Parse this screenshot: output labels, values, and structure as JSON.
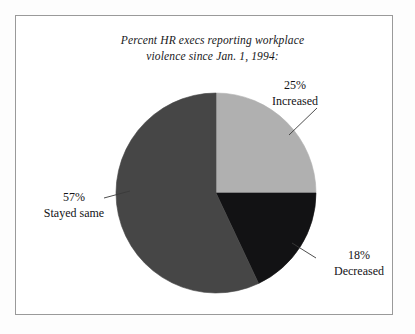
{
  "figure": {
    "title_line1": "Percent HR execs reporting workplace",
    "title_line2": "violence since Jan. 1, 1994:",
    "frame_color": "#9a9a9a",
    "background": "#ffffff"
  },
  "chart_data": {
    "type": "pie",
    "title": "Percent HR execs reporting workplace violence since Jan. 1, 1994:",
    "categories": [
      "Increased",
      "Decreased",
      "Stayed same"
    ],
    "values": [
      25,
      18,
      57
    ],
    "value_labels": [
      "25%",
      "18%",
      "Stayed same"
    ],
    "unit": "%",
    "legend": "none",
    "start_angle_deg": 0,
    "direction": "clockwise",
    "slices": [
      {
        "label": "Increased",
        "percent": 25,
        "percent_text": "25%",
        "color": "#b0b0b0",
        "start_deg": 0,
        "end_deg": 90
      },
      {
        "label": "Decreased",
        "percent": 18,
        "percent_text": "18%",
        "color": "#121214",
        "start_deg": 90,
        "end_deg": 154.8
      },
      {
        "label": "Stayed same",
        "percent": 57,
        "percent_text": "57%",
        "color": "#464646",
        "start_deg": 154.8,
        "end_deg": 360
      }
    ]
  },
  "labels": {
    "increased": {
      "percent": "25%",
      "category": "Increased"
    },
    "decreased": {
      "percent": "18%",
      "category": "Decreased"
    },
    "stayed_same": {
      "percent": "57%",
      "category": "Stayed same"
    }
  }
}
